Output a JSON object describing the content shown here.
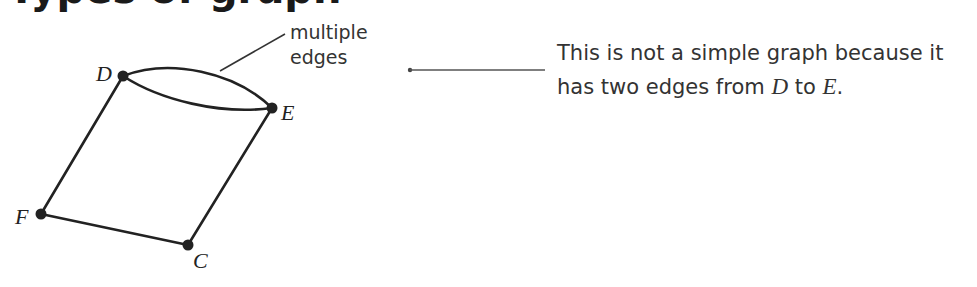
{
  "heading": {
    "text": "Types of graph"
  },
  "graph": {
    "vertices": [
      {
        "id": "D",
        "label": "D",
        "x": 123,
        "y": 76
      },
      {
        "id": "E",
        "label": "E",
        "x": 272,
        "y": 108
      },
      {
        "id": "F",
        "label": "F",
        "x": 41,
        "y": 214
      },
      {
        "id": "C",
        "label": "C",
        "x": 188,
        "y": 245
      }
    ],
    "edges": [
      {
        "from": "D",
        "to": "E",
        "type": "curved-upper"
      },
      {
        "from": "D",
        "to": "E",
        "type": "curved-lower"
      },
      {
        "from": "D",
        "to": "F"
      },
      {
        "from": "F",
        "to": "C"
      },
      {
        "from": "E",
        "to": "C"
      }
    ]
  },
  "annotation": {
    "line1": "multiple",
    "line2": "edges"
  },
  "note": {
    "line1": "This is not a simple graph because it",
    "line2_prefix": "has two edges from ",
    "var1": "D",
    "mid": " to ",
    "var2": "E",
    "suffix": "."
  },
  "colors": {
    "stroke": "#222222",
    "text": "#333333",
    "connector": "#555555"
  }
}
